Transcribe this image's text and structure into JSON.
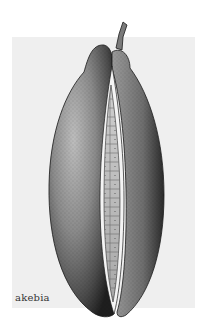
{
  "figure": {
    "caption": "akebia",
    "style": "stipple-ink-drawing"
  },
  "colors": {
    "page_background": "#ffffff",
    "panel_background": "#efefef",
    "ink": "#1a1a1a",
    "pulp": "#d9d9d9"
  }
}
